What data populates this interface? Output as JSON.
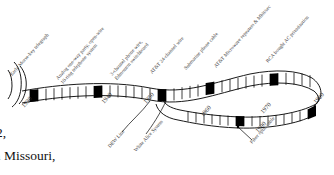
{
  "figure": {
    "type": "timeline-ribbon",
    "stroke_color": "#000000",
    "marker_fill": "#000000",
    "background": "#ffffff",
    "decade_markers": [
      {
        "label": "1930"
      },
      {
        "label": "1940"
      },
      {
        "label": "1950"
      },
      {
        "label": "1960"
      },
      {
        "label": "1970"
      },
      {
        "label": "1990"
      },
      {
        "label": "1980"
      }
    ],
    "top_labels": [
      {
        "line1": "Early Morse-key telegraph",
        "line2": ""
      },
      {
        "line1": "Analog one-way party, open-wire",
        "line2": "10-ring telephone system"
      },
      {
        "line1": "3-channel phone wire,",
        "line2": "Edmonton switchboard"
      },
      {
        "line1": "AT&T 24-channel wire",
        "line2": ""
      },
      {
        "line1": "Submarine phone cable",
        "line2": ""
      },
      {
        "line1": "AT&T Microwave repeaters & Mbit/sec",
        "line2": ""
      },
      {
        "line1": "RCA bought AC privatization",
        "line2": ""
      }
    ],
    "bottom_labels": [
      {
        "label": "DEW Line"
      },
      {
        "label": "White Alice System"
      },
      {
        "label": "Fiber optic cable"
      }
    ]
  },
  "page_text": {
    "line_1": "2,",
    "line_2": "in Missouri,"
  }
}
